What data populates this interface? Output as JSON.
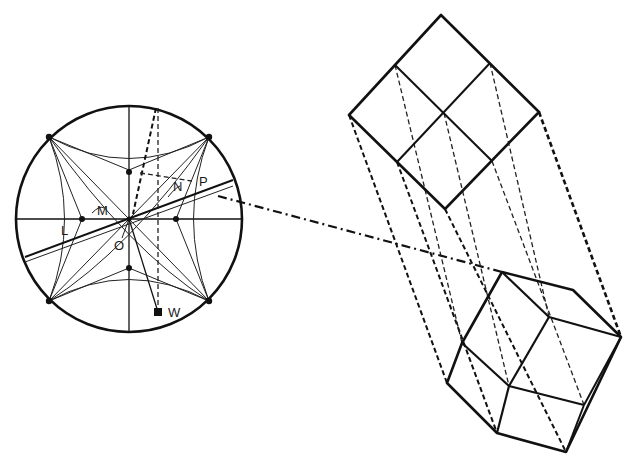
{
  "figure": {
    "type": "crystallographic stereographic projection with crystal projection",
    "labels": {
      "L": "L",
      "M": "M",
      "N": "N",
      "P": "P",
      "O": "O",
      "W": "W"
    },
    "stereogram": {
      "center": [
        129,
        219
      ],
      "radius": 113,
      "poles": [
        "L",
        "M",
        "N",
        "P",
        "O",
        "W"
      ]
    },
    "upper_crystal": {
      "shape": "square face divided into four quadrants (cube face view)"
    },
    "lower_crystal": {
      "shape": "rhombic/cube in oblique view"
    },
    "colors": {
      "ink": "#111111",
      "background": "#ffffff"
    }
  }
}
